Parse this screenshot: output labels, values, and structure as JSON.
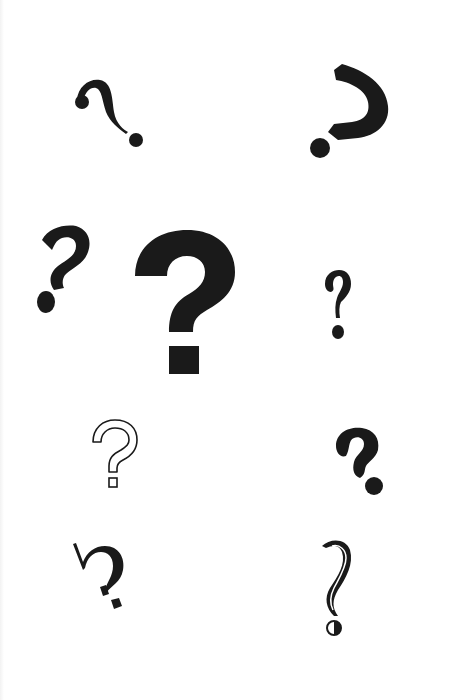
{
  "page": {
    "background": "#ffffff",
    "ink": "#1a1a1a"
  },
  "glyphs": [
    {
      "name": "serif-curl-question-mark",
      "style": "thin serif with ball terminal, tilted",
      "char": "?"
    },
    {
      "name": "rotated-bold-question-mark",
      "style": "heavy geometric, rotated clockwise",
      "char": "?"
    },
    {
      "name": "italic-bold-question-mark",
      "style": "heavy italic sans",
      "char": "?"
    },
    {
      "name": "large-bold-question-mark",
      "style": "very heavy sans, square dot",
      "char": "?"
    },
    {
      "name": "small-condensed-question-mark",
      "style": "bold condensed with round dot",
      "char": "?"
    },
    {
      "name": "outline-question-mark",
      "style": "outlined hollow sans",
      "char": "?"
    },
    {
      "name": "brush-question-mark",
      "style": "heavy brush script, round dot",
      "char": "?"
    },
    {
      "name": "serif-slab-question-mark",
      "style": "serif with slab spur, diamond dot",
      "char": "?"
    },
    {
      "name": "decorative-inline-question-mark",
      "style": "calligraphic inline swash, half-filled dot",
      "char": "?"
    }
  ]
}
